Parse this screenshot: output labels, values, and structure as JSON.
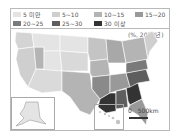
{
  "legend": {
    "items": [
      {
        "label": "5 미만",
        "color": "#e4e4e4"
      },
      {
        "label": "5~10",
        "color": "#cfcfcf"
      },
      {
        "label": "10~15",
        "color": "#b4b4b4"
      },
      {
        "label": "15~20",
        "color": "#999999"
      },
      {
        "label": "20~25",
        "color": "#7a7a7a"
      },
      {
        "label": "25~30",
        "color": "#5e5e5e"
      },
      {
        "label": "30 이상",
        "color": "#333333"
      }
    ]
  },
  "unit_label": "(%, 2020년)",
  "scale": {
    "zero": "0",
    "distance": "500km"
  },
  "insets": {
    "alaska": "Alaska",
    "hawaii": "Hawaii"
  },
  "map": {
    "title": "United States choropleth by state",
    "regions": [
      {
        "name": "Pacific Northwest",
        "class": "5 미만"
      },
      {
        "name": "Mountain West",
        "class": "5 미만"
      },
      {
        "name": "Great Plains",
        "class": "5 미만"
      },
      {
        "name": "Midwest",
        "class": "10~15"
      },
      {
        "name": "Northeast",
        "class": "10~15"
      },
      {
        "name": "Mid-Atlantic",
        "class": "20~25"
      },
      {
        "name": "Deep South (MS, LA, GA)",
        "class": "30 이상"
      },
      {
        "name": "Southeast (AL, SC)",
        "class": "25~30"
      },
      {
        "name": "Texas",
        "class": "10~15"
      },
      {
        "name": "Florida",
        "class": "15~20"
      }
    ]
  }
}
